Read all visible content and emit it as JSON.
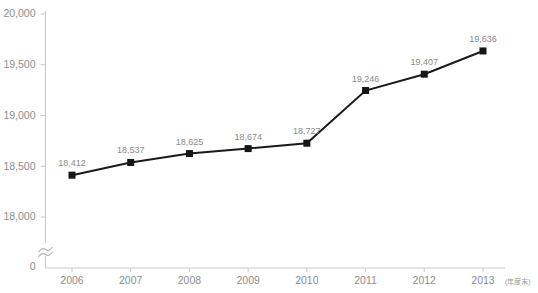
{
  "chart_data": {
    "type": "line",
    "title": "",
    "subtitle": "",
    "xlabel": "",
    "ylabel": "",
    "unit_note": "(年度末)",
    "categories": [
      "2006",
      "2007",
      "2008",
      "2009",
      "2010",
      "2011",
      "2012",
      "2013"
    ],
    "values": [
      18412,
      18537,
      18625,
      18674,
      18727,
      19246,
      19407,
      19636
    ],
    "point_labels": [
      "18,412",
      "18,537",
      "18,625",
      "18,674",
      "18,727",
      "19,246",
      "19,407",
      "19,636"
    ],
    "ylim": [
      18000,
      20000
    ],
    "y_ticks": [
      18000,
      18500,
      19000,
      19500,
      20000
    ],
    "y_tick_labels": [
      "18,000",
      "18,500",
      "19,000",
      "19,500",
      "20,000"
    ],
    "y_axis_break": true,
    "y_axis_origin_label": "0",
    "grid": false,
    "legend": null,
    "series": [
      {
        "name": "",
        "values": [
          18412,
          18537,
          18625,
          18674,
          18727,
          19246,
          19407,
          19636
        ],
        "color": "#1b1b1b",
        "marker": "square"
      }
    ],
    "colors": {
      "line": "#1b1b1b",
      "marker": "#151515",
      "axis": "#c9c9c9",
      "tick_text": "#8d8d8d",
      "label_text": "#8a8a8a",
      "background": "#ffffff"
    }
  }
}
